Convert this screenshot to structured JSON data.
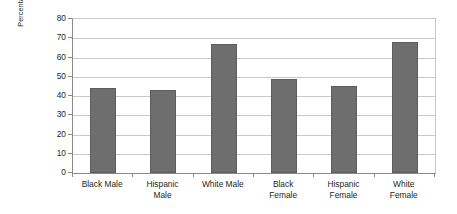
{
  "chart_data": {
    "type": "bar",
    "title": "",
    "subtitle": "",
    "xlabel": "",
    "ylabel": "Percentage Included in the Regular Classroom More Than 20% of Time",
    "ylabel_lines": [
      "Percentage Included in the Regular Classroom",
      "More Than 20% of Time"
    ],
    "categories": [
      "Black Male",
      "Hispanic Male",
      "White Male",
      "Black Female",
      "Hispanic Female",
      "White Female"
    ],
    "category_lines": [
      [
        "Black Male"
      ],
      [
        "Hispanic",
        "Male"
      ],
      [
        "White Male"
      ],
      [
        "Black",
        "Female"
      ],
      [
        "Hispanic",
        "Female"
      ],
      [
        "White",
        "Female"
      ]
    ],
    "values": [
      44,
      43,
      67,
      49,
      45,
      68
    ],
    "ylim": [
      0,
      80
    ],
    "ytick_step": 10,
    "yticks": [
      80,
      70,
      60,
      50,
      40,
      30,
      20,
      10,
      0
    ],
    "grid": true,
    "grid_axis": "y",
    "legend": false,
    "legend_position": "none",
    "bar_color": "#6e6e6e",
    "bar_border_color": "#5d5d5d",
    "gridline_color": "#c9c9c9",
    "axis_color": "#8a8a8a",
    "background_color": "#ffffff",
    "text_color": "#231f20"
  }
}
